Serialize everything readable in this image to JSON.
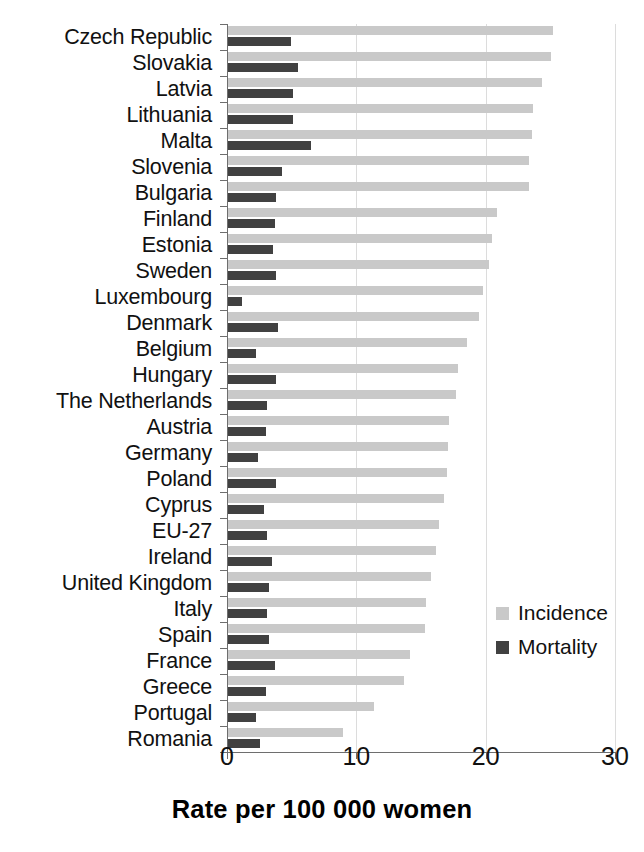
{
  "chart_data": {
    "type": "bar",
    "orientation": "horizontal",
    "title": "",
    "xlabel": "Rate per 100 000 women",
    "ylabel": "",
    "xlim": [
      0,
      30
    ],
    "xticks": [
      0,
      10,
      20,
      30
    ],
    "xtick_labels": [
      "0",
      "10",
      "20",
      "30"
    ],
    "grid": true,
    "grid_axis": "x",
    "legend_position": "center-right",
    "categories": [
      "Czech Republic",
      "Slovakia",
      "Latvia",
      "Lithuania",
      "Malta",
      "Slovenia",
      "Bulgaria",
      "Finland",
      "Estonia",
      "Sweden",
      "Luxembourg",
      "Denmark",
      "Belgium",
      "Hungary",
      "The Netherlands",
      "Austria",
      "Germany",
      "Poland",
      "Cyprus",
      "EU-27",
      "Ireland",
      "United Kingdom",
      "Italy",
      "Spain",
      "France",
      "Greece",
      "Portugal",
      "Romania"
    ],
    "series": [
      {
        "name": "Incidence",
        "color": "#c9c9c9",
        "values": [
          25.1,
          25.0,
          24.3,
          23.6,
          23.5,
          23.3,
          23.3,
          20.8,
          20.4,
          20.2,
          19.7,
          19.4,
          18.5,
          17.8,
          17.6,
          17.1,
          17.0,
          16.9,
          16.7,
          16.3,
          16.1,
          15.7,
          15.3,
          15.2,
          14.1,
          13.6,
          11.3,
          8.9
        ]
      },
      {
        "name": "Mortality",
        "color": "#414141",
        "values": [
          4.9,
          5.4,
          5.0,
          5.0,
          6.4,
          4.2,
          3.7,
          3.6,
          3.5,
          3.7,
          1.1,
          3.9,
          2.2,
          3.7,
          3.0,
          2.9,
          2.3,
          3.7,
          2.8,
          3.0,
          3.4,
          3.2,
          3.0,
          3.2,
          3.6,
          2.9,
          2.2,
          2.5
        ]
      }
    ]
  },
  "legend": {
    "items": [
      {
        "label": "Incidence"
      },
      {
        "label": "Mortality"
      }
    ]
  },
  "axis": {
    "x_title": "Rate per 100 000 women"
  }
}
